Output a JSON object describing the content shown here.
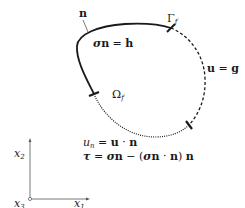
{
  "diagram": {
    "normal_label": "n",
    "boundary_label": "Γ",
    "boundary_subscript": "f",
    "domain_label": "Ω",
    "domain_subscript": "f",
    "neumann_condition": {
      "lhs_sigma": "σ",
      "lhs_n": "n",
      "eq": " = ",
      "rhs": "h"
    },
    "dirichlet_condition": {
      "lhs": "u",
      "eq": " = ",
      "rhs": "g"
    },
    "equations": {
      "line1": {
        "u": "u",
        "sub": "n",
        "rest_eq": " = ",
        "u_bold": "u",
        "dot": " · ",
        "n_bold": "n"
      },
      "line2": {
        "tau": "τ",
        "eq": " = ",
        "sigma1": "σ",
        "n1": "n",
        "minus": " − (",
        "sigma2": "σ",
        "n2": "n",
        "dot": " · ",
        "n3": "n",
        "close": ") ",
        "n4": "n"
      }
    },
    "axes": {
      "x1": "x",
      "x1_sub": "1",
      "x2": "x",
      "x2_sub": "2",
      "x3": "x",
      "x3_sub": "3"
    },
    "colors": {
      "stroke": "#1a1a1a",
      "background": "#ffffff"
    }
  }
}
